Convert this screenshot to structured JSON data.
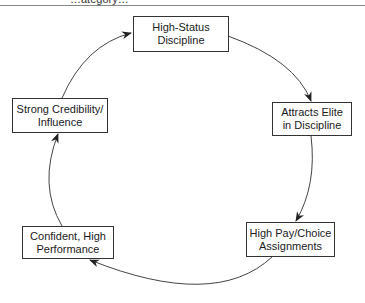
{
  "header": {
    "cut_off_text": "…ategory…"
  },
  "diagram": {
    "type": "cycle",
    "nodes": [
      {
        "id": "high-status",
        "line1": "High-Status",
        "line2": "Discipline"
      },
      {
        "id": "attracts-elite",
        "line1": "Attracts Elite",
        "line2": "in Discipline"
      },
      {
        "id": "high-pay",
        "line1": "High Pay/Choice",
        "line2": "Assignments"
      },
      {
        "id": "confident",
        "line1": "Confident, High",
        "line2": "Performance"
      },
      {
        "id": "credibility",
        "line1": "Strong Credibility/",
        "line2": "Influence"
      }
    ],
    "edges": [
      {
        "from": "high-status",
        "to": "attracts-elite"
      },
      {
        "from": "attracts-elite",
        "to": "high-pay"
      },
      {
        "from": "high-pay",
        "to": "confident"
      },
      {
        "from": "confident",
        "to": "credibility"
      },
      {
        "from": "credibility",
        "to": "high-status"
      }
    ],
    "colors": {
      "line": "#333333",
      "box_border": "#333333",
      "background": "#ffffff"
    }
  }
}
